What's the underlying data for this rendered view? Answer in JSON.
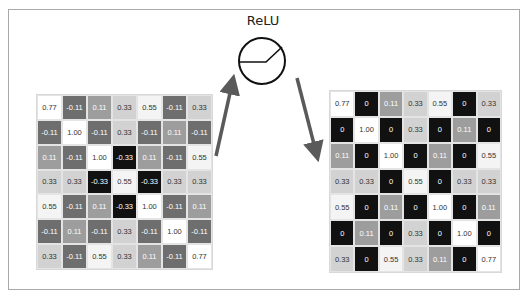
{
  "title": "ReLU",
  "colors": {
    "v_1.00": "#ffffff",
    "v_0.77": "#ffffff",
    "v_0.55": "#f4f4f4",
    "v_0.33": "#d2d2d2",
    "v_0.11": "#9d9d9d",
    "v_-0.11": "#6e6e6e",
    "v_-0.33": "#111111",
    "v_0": "#111111",
    "arrow": "#5a5a5a"
  },
  "input_matrix": {
    "label": "input feature map",
    "rows": [
      [
        "0.77",
        "-0.11",
        "0.11",
        "0.33",
        "0.55",
        "-0.11",
        "0.33"
      ],
      [
        "-0.11",
        "1.00",
        "-0.11",
        "0.33",
        "-0.11",
        "0.11",
        "-0.11"
      ],
      [
        "0.11",
        "-0.11",
        "1.00",
        "-0.33",
        "0.11",
        "-0.11",
        "0.55"
      ],
      [
        "0.33",
        "0.33",
        "-0.33",
        "0.55",
        "-0.33",
        "0.33",
        "0.33"
      ],
      [
        "0.55",
        "-0.11",
        "0.11",
        "-0.33",
        "1.00",
        "-0.11",
        "0.11"
      ],
      [
        "-0.11",
        "0.11",
        "-0.11",
        "0.33",
        "-0.11",
        "1.00",
        "-0.11"
      ],
      [
        "0.33",
        "-0.11",
        "0.55",
        "0.33",
        "0.11",
        "-0.11",
        "0.77"
      ]
    ]
  },
  "output_matrix": {
    "label": "rectified feature map",
    "rows": [
      [
        "0.77",
        "0",
        "0.11",
        "0.33",
        "0.55",
        "0",
        "0.33"
      ],
      [
        "0",
        "1.00",
        "0",
        "0.33",
        "0",
        "0.11",
        "0"
      ],
      [
        "0.11",
        "0",
        "1.00",
        "0",
        "0.11",
        "0",
        "0.55"
      ],
      [
        "0.33",
        "0.33",
        "0",
        "0.55",
        "0",
        "0.33",
        "0.33"
      ],
      [
        "0.55",
        "0",
        "0.11",
        "0",
        "1.00",
        "0",
        "0.11"
      ],
      [
        "0",
        "0.11",
        "0",
        "0.33",
        "0",
        "1.00",
        "0"
      ],
      [
        "0.33",
        "0",
        "0.55",
        "0.33",
        "0.11",
        "0",
        "0.77"
      ]
    ]
  }
}
